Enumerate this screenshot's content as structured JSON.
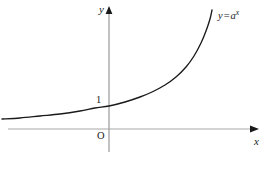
{
  "figure": {
    "background_color": "#ffffff"
  },
  "labels": {
    "y_axis": "y",
    "x_axis": "x",
    "origin": "O",
    "y_intercept": "1",
    "curve_base": "y = a",
    "curve_equals": "=",
    "curve_var": "y",
    "curve_a": "a",
    "curve_exponent": "x"
  },
  "colors": {
    "axis": "#a8a8a8",
    "curve": "#1a1a1a",
    "text": "#1a1a1a",
    "arrow": "#1a1a1a"
  },
  "chart_data": {
    "type": "line",
    "title": "",
    "xlabel": "x",
    "ylabel": "y",
    "annotations": [
      "y = a^x",
      "1",
      "O"
    ],
    "grid": false,
    "legend": "none",
    "axes": {
      "x_axis_y_px": 129,
      "y_axis_x_px": 109,
      "x_axis_start_px": 8,
      "x_axis_end_px": 258,
      "y_axis_top_px": 8,
      "y_axis_bottom_px": 152
    },
    "curve_points_px": [
      [
        2,
        119
      ],
      [
        20,
        118
      ],
      [
        40,
        116
      ],
      [
        60,
        114
      ],
      [
        80,
        111
      ],
      [
        95,
        108
      ],
      [
        109,
        106
      ],
      [
        125,
        102
      ],
      [
        140,
        97
      ],
      [
        152,
        92
      ],
      [
        165,
        85
      ],
      [
        176,
        77
      ],
      [
        186,
        67
      ],
      [
        194,
        56
      ],
      [
        201,
        43
      ],
      [
        206,
        31
      ],
      [
        210,
        19
      ],
      [
        212,
        10
      ]
    ]
  }
}
